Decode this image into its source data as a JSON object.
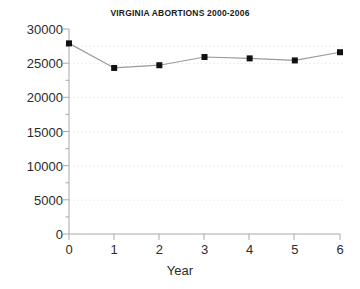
{
  "chart_data": {
    "type": "line",
    "title": "VIRGINIA ABORTIONS 2000-2006",
    "xlabel": "Year",
    "ylabel": "",
    "x": [
      0,
      1,
      2,
      3,
      4,
      5,
      6
    ],
    "values": [
      27900,
      24300,
      24700,
      25900,
      25700,
      25400,
      26600
    ],
    "series": [
      {
        "name": "Abortions",
        "values": [
          27900,
          24300,
          24700,
          25900,
          25700,
          25400,
          26600
        ]
      }
    ],
    "xlim": [
      0,
      6
    ],
    "ylim": [
      0,
      30000
    ],
    "xticks": [
      "0",
      "1",
      "2",
      "3",
      "4",
      "5",
      "6"
    ],
    "yticks": [
      "0",
      "5000",
      "10000",
      "15000",
      "20000",
      "25000",
      "30000"
    ],
    "ytick_values": [
      0,
      5000,
      10000,
      15000,
      20000,
      25000,
      30000
    ],
    "minor_ytick_values": [
      2500,
      7500,
      12500,
      17500,
      22500,
      27500
    ],
    "grid": true,
    "grid_style": "dotted-horizontal-minor",
    "legend": false,
    "legend_position": "none",
    "marker": "square",
    "line_color": "#999999",
    "marker_color": "#111111",
    "grid_color": "#e8e8e8",
    "axis_color": "#a8a8a8",
    "text_color": "#2b2b2b",
    "background": "#ffffff"
  }
}
